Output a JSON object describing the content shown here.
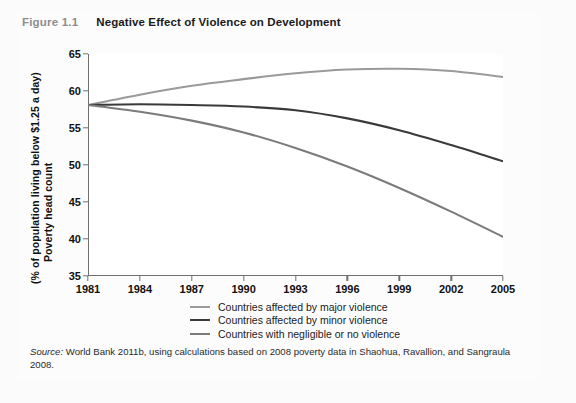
{
  "figure": {
    "number": "Figure 1.1",
    "title": "Negative Effect of Violence on Development"
  },
  "source": {
    "label": "Source:",
    "text": " World Bank 2011b, using calculations based on 2008 poverty data in Shaohua, Ravallion, and Sangraula 2008."
  },
  "colors": {
    "major_violence": "#9a9a9a",
    "minor_violence": "#3a3a3a",
    "negligible_violence": "#7b7b7b",
    "axis": "#6f6f6f",
    "text": "#111111",
    "figure_number": "#8d8d8d"
  },
  "legend": {
    "items": [
      {
        "label": "Countries affected by major violence",
        "color": "#9a9a9a"
      },
      {
        "label": "Countries affected by minor violence",
        "color": "#3a3a3a"
      },
      {
        "label": "Countries with negligible or no violence",
        "color": "#7b7b7b"
      }
    ]
  },
  "chart_data": {
    "type": "line",
    "title": "Negative Effect of Violence on Development",
    "xlabel": "",
    "ylabel_line1": "Poverty head count",
    "ylabel_line2": "(% of population living below $1.25 a day)",
    "x": [
      1981,
      1984,
      1987,
      1990,
      1993,
      1996,
      1999,
      2002,
      2005
    ],
    "xlim": [
      1981,
      2005
    ],
    "ylim": [
      35,
      65
    ],
    "yticks": [
      35,
      40,
      45,
      50,
      55,
      60,
      65
    ],
    "xticks": [
      1981,
      1984,
      1987,
      1990,
      1993,
      1996,
      1999,
      2002,
      2005
    ],
    "grid": false,
    "legend_position": "bottom",
    "series": [
      {
        "name": "Countries affected by major violence",
        "color": "#9a9a9a",
        "values": [
          58.1,
          59.5,
          60.7,
          61.6,
          62.4,
          62.9,
          63.0,
          62.7,
          61.9
        ]
      },
      {
        "name": "Countries affected by minor violence",
        "color": "#3a3a3a",
        "values": [
          58.1,
          58.2,
          58.1,
          57.9,
          57.4,
          56.3,
          54.7,
          52.7,
          50.5
        ]
      },
      {
        "name": "Countries with negligible or no violence",
        "color": "#7b7b7b",
        "values": [
          58.1,
          57.2,
          56.0,
          54.4,
          52.3,
          49.8,
          46.9,
          43.7,
          40.3
        ]
      }
    ]
  }
}
